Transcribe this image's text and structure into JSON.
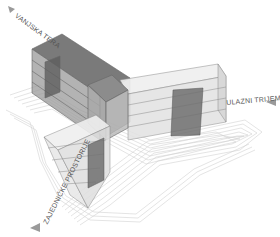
{
  "diagram": {
    "type": "architectural-axonometric",
    "background": "#ffffff",
    "colors": {
      "contour": "#cfcfcf",
      "volume_fill": "#e6e6e6",
      "volume_edge": "#8a8a8a",
      "dark_volume": "#6e6e6e",
      "label": "#555555",
      "arrow": "#9a9a9a"
    },
    "labels": [
      {
        "id": "terrace",
        "text": "VANJSKA TERASA",
        "visible_text": "VANJSKA TERA",
        "direction": "arrow-left-up"
      },
      {
        "id": "porch",
        "text": "ULAZNI TRIJEM",
        "direction": "arrow-right"
      },
      {
        "id": "common",
        "text": "ZAJEDNIČKE PROSTORIJE",
        "direction": "arrow-left-down"
      }
    ],
    "wings": [
      {
        "id": "north-west-wing",
        "floors": 4,
        "tone": "dark"
      },
      {
        "id": "east-wing",
        "floors": 4,
        "tone": "light"
      },
      {
        "id": "south-west-wing",
        "floors": 4,
        "tone": "light"
      }
    ]
  }
}
